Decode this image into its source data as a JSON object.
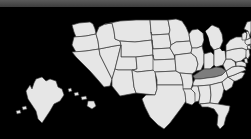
{
  "window": {
    "background_color": "#000000",
    "top_bar_color": "#4d4d4d",
    "width": 251,
    "height": 139
  },
  "map": {
    "title": "United States choropleth map",
    "projection": "albers-usa",
    "base_state_fill": "#e6e6e6",
    "border_color": "#3d3d3d",
    "highlight_fill": "#7d7d7d",
    "background": "#000000",
    "insets": [
      {
        "name": "alaska",
        "label": "Alaska"
      },
      {
        "name": "hawaii",
        "label": "Hawaii"
      }
    ],
    "highlighted_states": [
      "Kentucky"
    ],
    "states": [
      {
        "code": "WA",
        "name": "Washington",
        "highlighted": false
      },
      {
        "code": "OR",
        "name": "Oregon",
        "highlighted": false
      },
      {
        "code": "CA",
        "name": "California",
        "highlighted": false
      },
      {
        "code": "NV",
        "name": "Nevada",
        "highlighted": false
      },
      {
        "code": "ID",
        "name": "Idaho",
        "highlighted": false
      },
      {
        "code": "MT",
        "name": "Montana",
        "highlighted": false
      },
      {
        "code": "WY",
        "name": "Wyoming",
        "highlighted": false
      },
      {
        "code": "UT",
        "name": "Utah",
        "highlighted": false
      },
      {
        "code": "AZ",
        "name": "Arizona",
        "highlighted": false
      },
      {
        "code": "CO",
        "name": "Colorado",
        "highlighted": false
      },
      {
        "code": "NM",
        "name": "New Mexico",
        "highlighted": false
      },
      {
        "code": "ND",
        "name": "North Dakota",
        "highlighted": false
      },
      {
        "code": "SD",
        "name": "South Dakota",
        "highlighted": false
      },
      {
        "code": "NE",
        "name": "Nebraska",
        "highlighted": false
      },
      {
        "code": "KS",
        "name": "Kansas",
        "highlighted": false
      },
      {
        "code": "OK",
        "name": "Oklahoma",
        "highlighted": false
      },
      {
        "code": "TX",
        "name": "Texas",
        "highlighted": false
      },
      {
        "code": "MN",
        "name": "Minnesota",
        "highlighted": false
      },
      {
        "code": "IA",
        "name": "Iowa",
        "highlighted": false
      },
      {
        "code": "MO",
        "name": "Missouri",
        "highlighted": false
      },
      {
        "code": "AR",
        "name": "Arkansas",
        "highlighted": false
      },
      {
        "code": "LA",
        "name": "Louisiana",
        "highlighted": false
      },
      {
        "code": "WI",
        "name": "Wisconsin",
        "highlighted": false
      },
      {
        "code": "IL",
        "name": "Illinois",
        "highlighted": false
      },
      {
        "code": "MI",
        "name": "Michigan",
        "highlighted": false
      },
      {
        "code": "IN",
        "name": "Indiana",
        "highlighted": false
      },
      {
        "code": "OH",
        "name": "Ohio",
        "highlighted": false
      },
      {
        "code": "KY",
        "name": "Kentucky",
        "highlighted": true
      },
      {
        "code": "TN",
        "name": "Tennessee",
        "highlighted": false
      },
      {
        "code": "MS",
        "name": "Mississippi",
        "highlighted": false
      },
      {
        "code": "AL",
        "name": "Alabama",
        "highlighted": false
      },
      {
        "code": "GA",
        "name": "Georgia",
        "highlighted": false
      },
      {
        "code": "FL",
        "name": "Florida",
        "highlighted": false
      },
      {
        "code": "SC",
        "name": "South Carolina",
        "highlighted": false
      },
      {
        "code": "NC",
        "name": "North Carolina",
        "highlighted": false
      },
      {
        "code": "VA",
        "name": "Virginia",
        "highlighted": false
      },
      {
        "code": "WV",
        "name": "West Virginia",
        "highlighted": false
      },
      {
        "code": "MD",
        "name": "Maryland",
        "highlighted": false
      },
      {
        "code": "DE",
        "name": "Delaware",
        "highlighted": false
      },
      {
        "code": "PA",
        "name": "Pennsylvania",
        "highlighted": false
      },
      {
        "code": "NJ",
        "name": "New Jersey",
        "highlighted": false
      },
      {
        "code": "NY",
        "name": "New York",
        "highlighted": false
      },
      {
        "code": "CT",
        "name": "Connecticut",
        "highlighted": false
      },
      {
        "code": "RI",
        "name": "Rhode Island",
        "highlighted": false
      },
      {
        "code": "MA",
        "name": "Massachusetts",
        "highlighted": false
      },
      {
        "code": "VT",
        "name": "Vermont",
        "highlighted": false
      },
      {
        "code": "NH",
        "name": "New Hampshire",
        "highlighted": false
      },
      {
        "code": "ME",
        "name": "Maine",
        "highlighted": false
      },
      {
        "code": "AK",
        "name": "Alaska",
        "highlighted": false
      },
      {
        "code": "HI",
        "name": "Hawaii",
        "highlighted": false
      }
    ]
  }
}
